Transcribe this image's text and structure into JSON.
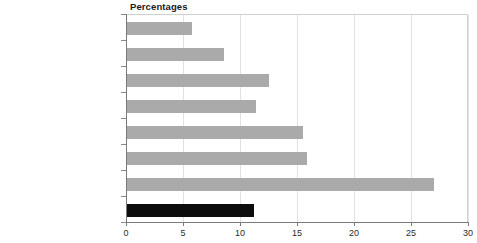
{
  "chart_data": {
    "type": "bar",
    "orientation": "horizontal",
    "title": "Percentages",
    "xlabel": "",
    "ylabel": "",
    "xlim": [
      0,
      30
    ],
    "xticks": [
      0,
      5,
      10,
      15,
      20,
      25,
      30
    ],
    "grid": true,
    "legend": null,
    "categories": [
      "Professional",
      "Managerial and technical occupations",
      "Skilled occcupations non-manual",
      "Skilled occupations manual",
      "Partly-skilled occupations",
      "Unskilled occupations",
      "Never worked",
      "All"
    ],
    "values": [
      5.8,
      8.6,
      12.5,
      11.4,
      15.5,
      15.9,
      27.0,
      11.2
    ],
    "bar_colors": [
      "#aaaaaa",
      "#aaaaaa",
      "#aaaaaa",
      "#aaaaaa",
      "#aaaaaa",
      "#aaaaaa",
      "#aaaaaa",
      "#0d0d0d"
    ]
  },
  "colors": {
    "bar_gray": "#aaaaaa",
    "bar_black": "#0d0d0d",
    "gridline": "#e2e2e2",
    "axis": "#7a7a7a",
    "text": "#2b2b2b"
  }
}
